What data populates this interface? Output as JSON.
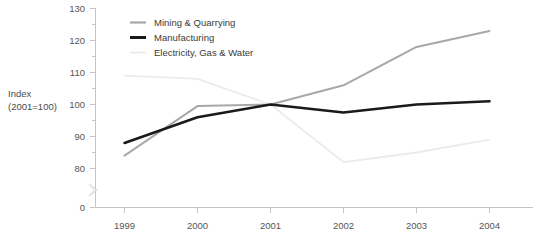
{
  "chart_data": {
    "type": "line",
    "title": "",
    "subtitle": "",
    "xlabel": "",
    "ylabel": "Index (2001=100)",
    "ylabel_line1": "Index",
    "ylabel_line2": "(2001=100)",
    "categories": [
      "1999",
      "2000",
      "2001",
      "2002",
      "2003",
      "2004"
    ],
    "x": [
      1999,
      2000,
      2001,
      2002,
      2003,
      2004
    ],
    "xlim": [
      1999,
      2004
    ],
    "ylim": [
      80,
      130
    ],
    "y_ticks": [
      0,
      80,
      90,
      100,
      110,
      120,
      130
    ],
    "y_tick_labels": [
      "0",
      "80",
      "90",
      "100",
      "110",
      "120",
      "130"
    ],
    "y_axis_break": true,
    "y_axis_break_between": [
      0,
      80
    ],
    "grid": false,
    "legend_position": "top-center",
    "series": [
      {
        "name": "Mining & Quarrying",
        "color": "#a8a8a8",
        "width": 2.0,
        "values": [
          84,
          99.5,
          100,
          106,
          118,
          123
        ]
      },
      {
        "name": "Manufacturing",
        "color": "#1a1a1a",
        "width": 2.6,
        "values": [
          88,
          96,
          100,
          97.5,
          100,
          101
        ]
      },
      {
        "name": "Electricity, Gas & Water",
        "color": "#ebebeb",
        "width": 1.8,
        "values": [
          109,
          108,
          100,
          82,
          85,
          89
        ]
      }
    ]
  },
  "legend": {
    "items": [
      {
        "label": "Mining & Quarrying",
        "color": "#a8a8a8",
        "width": 2.0
      },
      {
        "label": "Manufacturing",
        "color": "#1a1a1a",
        "width": 2.8
      },
      {
        "label": "Electricity, Gas & Water",
        "color": "#ebebeb",
        "width": 1.8
      }
    ]
  },
  "colors": {
    "axis": "#c4c4c4",
    "tick_label": "#555555",
    "axis_label": "#4a4a4a",
    "background": "#ffffff",
    "mining": "#a8a8a8",
    "manufacturing": "#1a1a1a",
    "electricity": "#ebebeb"
  },
  "footnote": {
    "text": ""
  }
}
